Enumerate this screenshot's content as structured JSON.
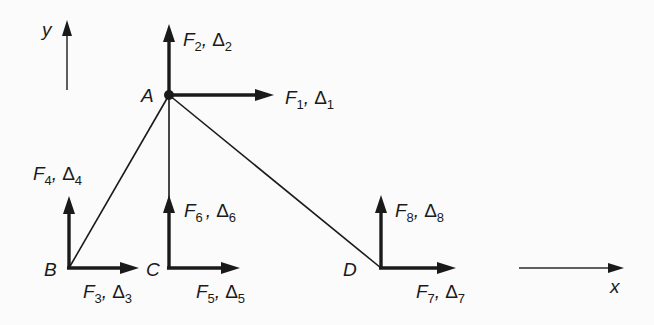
{
  "figure": {
    "colors": {
      "background": "#fbfbfb",
      "ink": "#1a1a1a"
    }
  },
  "axes": {
    "x_label": "x",
    "y_label": "y"
  },
  "nodes": [
    {
      "id": "A",
      "label": "A",
      "x": 169,
      "y": 95
    },
    {
      "id": "B",
      "label": "B",
      "x": 69,
      "y": 268
    },
    {
      "id": "C",
      "label": "C",
      "x": 169,
      "y": 268
    },
    {
      "id": "D",
      "label": "D",
      "x": 381,
      "y": 268
    }
  ],
  "members": [
    {
      "from": "A",
      "to": "B"
    },
    {
      "from": "A",
      "to": "C"
    },
    {
      "from": "A",
      "to": "D"
    }
  ],
  "dofs": [
    {
      "node": "A",
      "dir": "x",
      "force": "F",
      "disp": "Δ",
      "index": "1"
    },
    {
      "node": "A",
      "dir": "y",
      "force": "F",
      "disp": "Δ",
      "index": "2"
    },
    {
      "node": "B",
      "dir": "x",
      "force": "F",
      "disp": "Δ",
      "index": "3"
    },
    {
      "node": "B",
      "dir": "y",
      "force": "F",
      "disp": "Δ",
      "index": "4"
    },
    {
      "node": "C",
      "dir": "x",
      "force": "F",
      "disp": "Δ",
      "index": "5"
    },
    {
      "node": "C",
      "dir": "y",
      "force": "F",
      "disp": "Δ",
      "index": "6"
    },
    {
      "node": "D",
      "dir": "x",
      "force": "F",
      "disp": "Δ",
      "index": "7"
    },
    {
      "node": "D",
      "dir": "y",
      "force": "F",
      "disp": "Δ",
      "index": "8"
    }
  ],
  "labels": {
    "node_A": "A",
    "node_B": "B",
    "node_C": "C",
    "node_D": "D",
    "F": "F",
    "comma": ",",
    "delta": "Δ",
    "sub1": "1",
    "sub2": "2",
    "sub3": "3",
    "sub4": "4",
    "sub5": "5",
    "sub6": "6",
    "sub7": "7",
    "sub8": "8",
    "x_axis": "x",
    "y_axis": "y"
  }
}
